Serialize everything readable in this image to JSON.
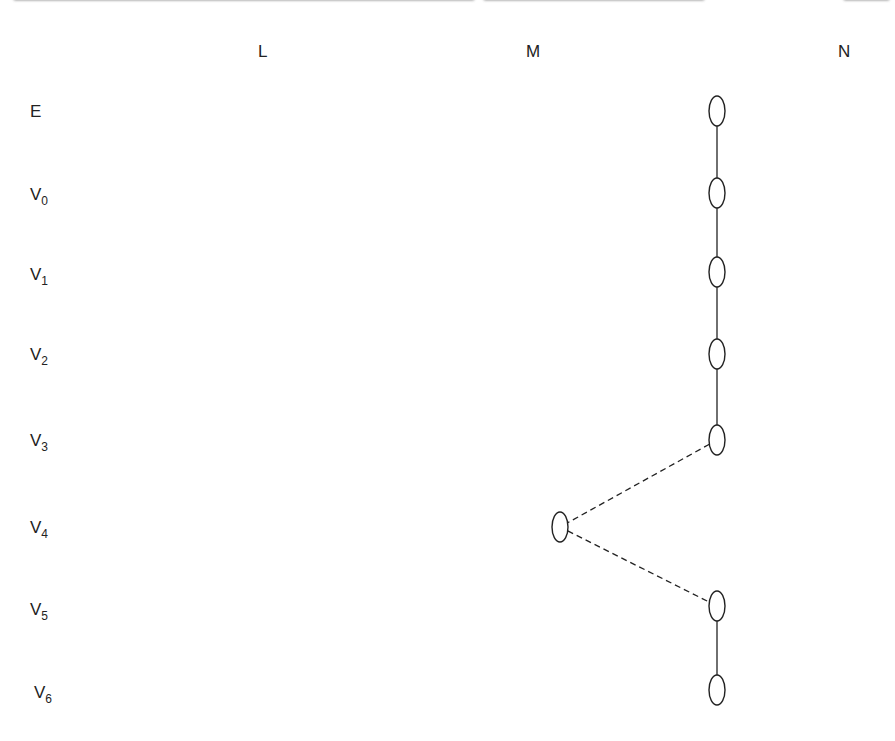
{
  "header": {
    "text": "(truncated running header)"
  },
  "columns": [
    {
      "id": "L",
      "label": "L"
    },
    {
      "id": "M",
      "label": "M"
    },
    {
      "id": "N",
      "label": "N"
    }
  ],
  "rows": [
    {
      "id": "E",
      "label": "E",
      "sub": ""
    },
    {
      "id": "V0",
      "label": "V",
      "sub": "0"
    },
    {
      "id": "V1",
      "label": "V",
      "sub": "1"
    },
    {
      "id": "V2",
      "label": "V",
      "sub": "2"
    },
    {
      "id": "V3",
      "label": "V",
      "sub": "3"
    },
    {
      "id": "V4",
      "label": "V",
      "sub": "4"
    },
    {
      "id": "V5",
      "label": "V",
      "sub": "5"
    },
    {
      "id": "V6",
      "label": "V",
      "sub": "6"
    }
  ],
  "nodes": [
    {
      "row": "E",
      "col": "N"
    },
    {
      "row": "V0",
      "col": "N"
    },
    {
      "row": "V1",
      "col": "N"
    },
    {
      "row": "V2",
      "col": "N"
    },
    {
      "row": "V3",
      "col": "N"
    },
    {
      "row": "V4",
      "col": "M"
    },
    {
      "row": "V5",
      "col": "N"
    },
    {
      "row": "V6",
      "col": "N"
    }
  ],
  "edges": [
    {
      "from": 0,
      "to": 1,
      "style": "solid"
    },
    {
      "from": 1,
      "to": 2,
      "style": "solid"
    },
    {
      "from": 2,
      "to": 3,
      "style": "solid"
    },
    {
      "from": 3,
      "to": 4,
      "style": "solid"
    },
    {
      "from": 4,
      "to": 5,
      "style": "dashed"
    },
    {
      "from": 5,
      "to": 6,
      "style": "dashed"
    },
    {
      "from": 6,
      "to": 7,
      "style": "solid"
    }
  ]
}
